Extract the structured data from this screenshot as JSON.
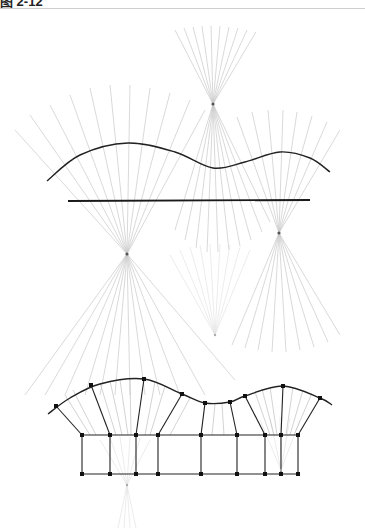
{
  "header": {
    "clipped_text": "图 2-12",
    "divider_color": "#cfcfcf"
  },
  "colors": {
    "ray": "#c8c8c8",
    "ray_faint": "#e4e4e4",
    "curve": "#222222",
    "line": "#1a1a1a",
    "focus": "#555555",
    "node": "#111111",
    "grid": "#222222"
  },
  "diagram": {
    "top_section": {
      "wave_curve": {
        "points": [
          [
            47,
            181
          ],
          [
            80,
            155
          ],
          [
            128,
            143
          ],
          [
            175,
            152
          ],
          [
            213,
            168
          ],
          [
            245,
            162
          ],
          [
            280,
            152
          ],
          [
            310,
            158
          ],
          [
            330,
            172
          ]
        ]
      },
      "straight_line": {
        "x1": 68,
        "y1": 201,
        "x2": 310,
        "y2": 200
      },
      "foci": [
        {
          "name": "focus-top",
          "x": 213,
          "y": 104,
          "ray_ends_above": [
            [
              175,
              30
            ],
            [
              184,
              28
            ],
            [
              193,
              27
            ],
            [
              202,
              26
            ],
            [
              211,
              26
            ],
            [
              220,
              26
            ],
            [
              229,
              27
            ],
            [
              238,
              28
            ],
            [
              247,
              30
            ],
            [
              256,
              32
            ]
          ],
          "ray_ends_below": [
            [
              175,
              230
            ],
            [
              185,
              240
            ],
            [
              196,
              248
            ],
            [
              207,
              252
            ],
            [
              218,
              252
            ],
            [
              229,
              250
            ],
            [
              240,
              246
            ],
            [
              251,
              240
            ],
            [
              262,
              232
            ],
            [
              270,
              222
            ]
          ]
        },
        {
          "name": "focus-left",
          "x": 127,
          "y": 254,
          "ray_ends_above": [
            [
              15,
              130
            ],
            [
              30,
              115
            ],
            [
              50,
              105
            ],
            [
              70,
              95
            ],
            [
              90,
              88
            ],
            [
              110,
              85
            ],
            [
              130,
              85
            ],
            [
              150,
              88
            ],
            [
              170,
              93
            ],
            [
              190,
              100
            ],
            [
              205,
              110
            ]
          ],
          "ray_ends_below": [
            [
              25,
              395
            ],
            [
              45,
              395
            ],
            [
              65,
              395
            ],
            [
              85,
              395
            ],
            [
              100,
              395
            ],
            [
              115,
              395
            ],
            [
              130,
              395
            ],
            [
              145,
              395
            ],
            [
              160,
              395
            ],
            [
              180,
              395
            ],
            [
              205,
              395
            ],
            [
              235,
              380
            ]
          ]
        },
        {
          "name": "focus-right",
          "x": 279,
          "y": 233,
          "ray_ends_above": [
            [
              237,
              117
            ],
            [
              252,
              112
            ],
            [
              268,
              110
            ],
            [
              283,
              110
            ],
            [
              297,
              112
            ],
            [
              312,
              116
            ],
            [
              327,
              122
            ],
            [
              340,
              130
            ]
          ],
          "ray_ends_below": [
            [
              232,
              345
            ],
            [
              245,
              348
            ],
            [
              258,
              350
            ],
            [
              272,
              352
            ],
            [
              286,
              352
            ],
            [
              300,
              350
            ],
            [
              314,
              347
            ],
            [
              328,
              342
            ],
            [
              340,
              335
            ]
          ]
        },
        {
          "name": "focus-faint-mid",
          "x": 215,
          "y": 335,
          "faint": true,
          "ray_ends_above": [
            [
              170,
              255
            ],
            [
              180,
              250
            ],
            [
              190,
              247
            ],
            [
              200,
              245
            ],
            [
              210,
              244
            ],
            [
              220,
              244
            ],
            [
              230,
              245
            ],
            [
              240,
              247
            ],
            [
              250,
              250
            ]
          ],
          "ray_ends_below": []
        }
      ]
    },
    "bottom_section": {
      "wave_curve": {
        "points": [
          [
            48,
            414
          ],
          [
            70,
            398
          ],
          [
            100,
            384
          ],
          [
            144,
            379
          ],
          [
            182,
            394
          ],
          [
            205,
            403
          ],
          [
            230,
            402
          ],
          [
            245,
            396
          ],
          [
            283,
            386
          ],
          [
            320,
            398
          ],
          [
            332,
            405
          ]
        ]
      },
      "curve_nodes": [
        [
          56,
          406
        ],
        [
          91,
          385
        ],
        [
          144,
          379
        ],
        [
          182,
          394
        ],
        [
          205,
          403
        ],
        [
          230,
          402
        ],
        [
          245,
          396
        ],
        [
          283,
          386
        ],
        [
          320,
          398
        ]
      ],
      "grid": {
        "top_y": 435,
        "bottom_y": 474,
        "columns_x": [
          82,
          110,
          136,
          158,
          201,
          237,
          265,
          281,
          298
        ]
      },
      "connectors": [
        [
          [
            56,
            406
          ],
          [
            82,
            435
          ]
        ],
        [
          [
            91,
            385
          ],
          [
            110,
            435
          ]
        ],
        [
          [
            144,
            379
          ],
          [
            136,
            435
          ]
        ],
        [
          [
            182,
            394
          ],
          [
            158,
            435
          ]
        ],
        [
          [
            205,
            403
          ],
          [
            201,
            435
          ]
        ],
        [
          [
            230,
            402
          ],
          [
            237,
            435
          ]
        ],
        [
          [
            245,
            396
          ],
          [
            265,
            435
          ]
        ],
        [
          [
            283,
            386
          ],
          [
            281,
            435
          ]
        ],
        [
          [
            320,
            398
          ],
          [
            298,
            435
          ]
        ]
      ],
      "fill_rays": [
        [
          [
            65,
            395
          ],
          [
            90,
            435
          ]
        ],
        [
          [
            73,
            390
          ],
          [
            96,
            435
          ]
        ],
        [
          [
            100,
            383
          ],
          [
            116,
            435
          ]
        ],
        [
          [
            110,
            381
          ],
          [
            122,
            435
          ]
        ],
        [
          [
            120,
            380
          ],
          [
            128,
            435
          ]
        ],
        [
          [
            130,
            379
          ],
          [
            131,
            435
          ]
        ],
        [
          [
            155,
            382
          ],
          [
            145,
            435
          ]
        ],
        [
          [
            165,
            386
          ],
          [
            150,
            435
          ]
        ],
        [
          [
            190,
            398
          ],
          [
            170,
            435
          ]
        ],
        [
          [
            215,
            404
          ],
          [
            212,
            435
          ]
        ],
        [
          [
            222,
            404
          ],
          [
            224,
            435
          ]
        ],
        [
          [
            255,
            392
          ],
          [
            270,
            435
          ]
        ],
        [
          [
            262,
            389
          ],
          [
            274,
            435
          ]
        ],
        [
          [
            270,
            387
          ],
          [
            277,
            435
          ]
        ],
        [
          [
            293,
            387
          ],
          [
            286,
            435
          ]
        ],
        [
          [
            303,
            390
          ],
          [
            290,
            435
          ]
        ],
        [
          [
            312,
            393
          ],
          [
            294,
            435
          ]
        ]
      ],
      "foci": [
        {
          "name": "focus-bottom-faint",
          "x": 127,
          "y": 485,
          "faint": true,
          "ray_ends_above": [
            [
              100,
              440
            ],
            [
              110,
              438
            ],
            [
              120,
              437
            ],
            [
              130,
              437
            ],
            [
              140,
              438
            ],
            [
              150,
              440
            ]
          ],
          "ray_ends_below": [
            [
              118,
              528
            ],
            [
              124,
              528
            ],
            [
              130,
              528
            ],
            [
              136,
              528
            ]
          ]
        },
        {
          "name": "focus-bottom-right-faint",
          "x": 281,
          "y": 470,
          "faint": true,
          "ray_ends_above": [
            [
              260,
              420
            ],
            [
              270,
              418
            ],
            [
              280,
              417
            ],
            [
              290,
              418
            ],
            [
              300,
              420
            ]
          ],
          "ray_ends_below": []
        }
      ]
    }
  }
}
